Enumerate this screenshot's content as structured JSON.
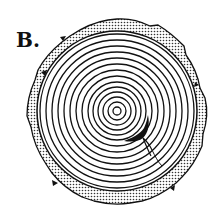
{
  "figure": {
    "label": "B.",
    "center": [
      117,
      111
    ],
    "ring_radii": [
      4,
      9,
      14,
      19,
      24,
      29,
      35,
      41,
      47,
      53,
      59,
      65,
      71,
      77
    ],
    "bark_inner_radius": 80,
    "bark_outer_radius": 92,
    "colors": {
      "ink": "#111111",
      "bark_fill": "#d8d8d8",
      "background": "#ffffff"
    }
  }
}
